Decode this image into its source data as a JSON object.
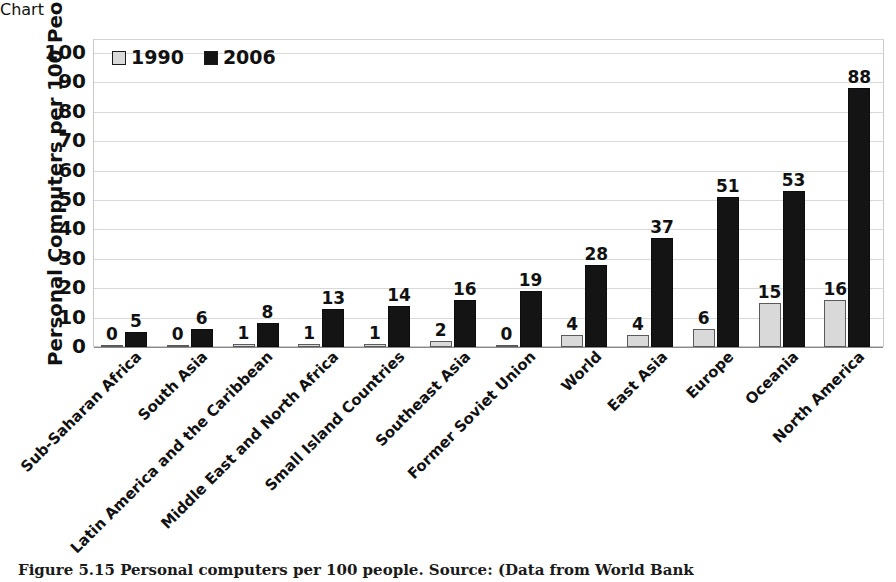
{
  "chart_data": {
    "type": "bar",
    "title": "",
    "xlabel": "",
    "ylabel": "Personal Computers per 100 People",
    "ylim": [
      0,
      100
    ],
    "ytick_step": 10,
    "yticks": [
      100,
      90,
      80,
      70,
      60,
      50,
      40,
      30,
      20,
      10,
      0
    ],
    "grid": true,
    "legend_position": "top-left",
    "categories": [
      "Sub-Saharan Africa",
      "South Asia",
      "Latin America and the Caribbean",
      "Middle East and North Africa",
      "Small Island Countries",
      "Southeast Asia",
      "Former Soviet Union",
      "World",
      "East Asia",
      "Europe",
      "Oceania",
      "North America"
    ],
    "series": [
      {
        "name": "1990",
        "color": "#d9d9d9",
        "values": [
          0,
          0,
          1,
          1,
          1,
          2,
          0,
          4,
          4,
          6,
          15,
          16
        ]
      },
      {
        "name": "2006",
        "color": "#141414",
        "values": [
          5,
          6,
          8,
          13,
          14,
          16,
          19,
          28,
          37,
          51,
          53,
          88
        ]
      }
    ]
  },
  "legend": {
    "entries": [
      {
        "label": "1990",
        "color": "#d9d9d9"
      },
      {
        "label": "2006",
        "color": "#141414"
      }
    ]
  },
  "caption": {
    "text": "Figure 5.15   Personal computers per 100 people.  Source: (Data from World Bank"
  }
}
